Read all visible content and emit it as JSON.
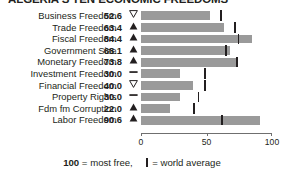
{
  "title": "ALGERIA'S TEN ECONOMIC FREEDOMS",
  "footer": {
    "scale_value": "100",
    "scale_text": " = most free,",
    "legend_icon": "world-average-tick",
    "legend_text": " = world average"
  },
  "axis": {
    "ticks": [
      "0",
      "50",
      "100"
    ],
    "min": 0,
    "max": 100
  },
  "chart_data": {
    "type": "bar",
    "orientation": "horizontal",
    "title": "ALGERIA'S TEN ECONOMIC FREEDOMS",
    "xlabel": "",
    "ylabel": "",
    "xlim": [
      0,
      100
    ],
    "xticks": [
      0,
      50,
      100
    ],
    "grid": false,
    "legend_position": "bottom",
    "legend": [
      "100 = most free",
      "| = world average"
    ],
    "bar_color": "#9a9a9a",
    "marker_color": "#231f20",
    "categories": [
      "Business Freedom",
      "Trade Freedom",
      "Fiscal Freedom",
      "Government Size",
      "Monetary Freedom",
      "Investment Freedom",
      "Financial Freedom",
      "Property Rights",
      "Fdm fm Corruption",
      "Labor Freedom"
    ],
    "values": [
      52.6,
      63.4,
      84.4,
      68.1,
      73.8,
      30.0,
      40.0,
      30.0,
      22.0,
      90.6
    ],
    "world_average": [
      61.0,
      72.0,
      74.5,
      65.0,
      73.5,
      49.0,
      49.0,
      44.0,
      40.5,
      62.0
    ],
    "trends": [
      "down",
      "up",
      "up",
      "up",
      "up",
      "flat",
      "down",
      "flat",
      "up",
      "up"
    ]
  },
  "rows": [
    {
      "label": "Business Freedom",
      "value": "52.6",
      "num": 52.6,
      "avg": 61.0,
      "trend": "down"
    },
    {
      "label": "Trade Freedom",
      "value": "63.4",
      "num": 63.4,
      "avg": 72.0,
      "trend": "up"
    },
    {
      "label": "Fiscal Freedom",
      "value": "84.4",
      "num": 84.4,
      "avg": 74.5,
      "trend": "up"
    },
    {
      "label": "Government Size",
      "value": "68.1",
      "num": 68.1,
      "avg": 65.0,
      "trend": "up"
    },
    {
      "label": "Monetary Freedom",
      "value": "73.8",
      "num": 73.8,
      "avg": 73.5,
      "trend": "up"
    },
    {
      "label": "Investment Freedom",
      "value": "30.0",
      "num": 30.0,
      "avg": 49.0,
      "trend": "flat"
    },
    {
      "label": "Financial Freedom",
      "value": "40.0",
      "num": 40.0,
      "avg": 49.0,
      "trend": "down"
    },
    {
      "label": "Property Rights",
      "value": "30.0",
      "num": 30.0,
      "avg": 44.0,
      "trend": "flat"
    },
    {
      "label": "Fdm fm Corruption",
      "value": "22.0",
      "num": 22.0,
      "avg": 40.5,
      "trend": "up"
    },
    {
      "label": "Labor Freedom",
      "value": "90.6",
      "num": 90.6,
      "avg": 62.0,
      "trend": "up"
    }
  ]
}
